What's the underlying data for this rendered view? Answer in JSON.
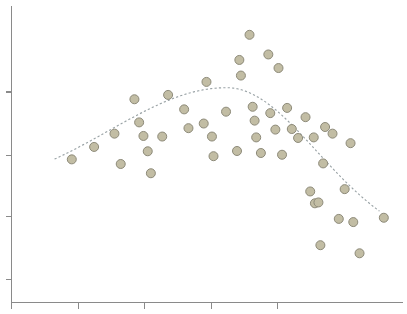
{
  "chart": {
    "title": "",
    "subtitle": "",
    "background_color": "#ffffff",
    "point_color": "#c2bda4",
    "point_edge_color": "#8d8a79",
    "trend_color": "#9aa3a6",
    "axis_color": "#8a8a8a"
  },
  "chart_data": {
    "type": "scatter",
    "title": "",
    "xlabel": "",
    "ylabel": "",
    "xlim": [
      0,
      100
    ],
    "ylim": [
      0,
      100
    ],
    "grid": false,
    "legend": "none",
    "xticks": [
      0,
      17,
      34,
      51,
      68
    ],
    "xtick_labels": [
      "",
      "",
      "",
      "",
      ""
    ],
    "yticks": [
      8,
      30,
      51,
      73
    ],
    "ytick_labels": [
      "",
      "",
      "",
      ""
    ],
    "marker": "circle",
    "marker_size": 9,
    "points": [
      {
        "x": 15.4,
        "y": 49.7
      },
      {
        "x": 21.1,
        "y": 54.0
      },
      {
        "x": 26.3,
        "y": 58.6
      },
      {
        "x": 27.9,
        "y": 48.1
      },
      {
        "x": 31.4,
        "y": 70.5
      },
      {
        "x": 32.6,
        "y": 62.5
      },
      {
        "x": 33.7,
        "y": 57.8
      },
      {
        "x": 34.8,
        "y": 52.5
      },
      {
        "x": 35.6,
        "y": 44.9
      },
      {
        "x": 38.5,
        "y": 57.6
      },
      {
        "x": 40.0,
        "y": 72.0
      },
      {
        "x": 44.1,
        "y": 67.0
      },
      {
        "x": 45.2,
        "y": 60.5
      },
      {
        "x": 49.1,
        "y": 62.1
      },
      {
        "x": 49.8,
        "y": 76.5
      },
      {
        "x": 51.2,
        "y": 57.6
      },
      {
        "x": 51.6,
        "y": 50.8
      },
      {
        "x": 54.8,
        "y": 66.2
      },
      {
        "x": 57.6,
        "y": 52.6
      },
      {
        "x": 58.2,
        "y": 84.1
      },
      {
        "x": 58.6,
        "y": 78.7
      },
      {
        "x": 60.8,
        "y": 92.8
      },
      {
        "x": 61.6,
        "y": 67.9
      },
      {
        "x": 62.1,
        "y": 63.1
      },
      {
        "x": 62.5,
        "y": 57.3
      },
      {
        "x": 63.7,
        "y": 51.9
      },
      {
        "x": 65.6,
        "y": 86.0
      },
      {
        "x": 66.1,
        "y": 65.7
      },
      {
        "x": 67.4,
        "y": 60.0
      },
      {
        "x": 68.2,
        "y": 81.3
      },
      {
        "x": 69.1,
        "y": 51.3
      },
      {
        "x": 70.4,
        "y": 67.5
      },
      {
        "x": 71.6,
        "y": 60.2
      },
      {
        "x": 73.2,
        "y": 57.1
      },
      {
        "x": 75.1,
        "y": 64.3
      },
      {
        "x": 76.3,
        "y": 38.6
      },
      {
        "x": 77.2,
        "y": 57.3
      },
      {
        "x": 77.5,
        "y": 34.5
      },
      {
        "x": 78.4,
        "y": 34.8
      },
      {
        "x": 78.9,
        "y": 20.0
      },
      {
        "x": 79.6,
        "y": 48.3
      },
      {
        "x": 80.1,
        "y": 60.9
      },
      {
        "x": 82.0,
        "y": 58.6
      },
      {
        "x": 83.6,
        "y": 29.1
      },
      {
        "x": 85.1,
        "y": 39.4
      },
      {
        "x": 86.6,
        "y": 55.3
      },
      {
        "x": 87.3,
        "y": 28.0
      },
      {
        "x": 88.9,
        "y": 17.2
      },
      {
        "x": 95.1,
        "y": 29.5
      }
    ],
    "trend": {
      "style": "dashed",
      "shape": "unimodal-peak",
      "peak_x": 55.0,
      "peak_y": 74.5,
      "x_start": 11.0,
      "x_end": 94.0,
      "y_start": 37.0,
      "y_end": 18.5
    }
  }
}
